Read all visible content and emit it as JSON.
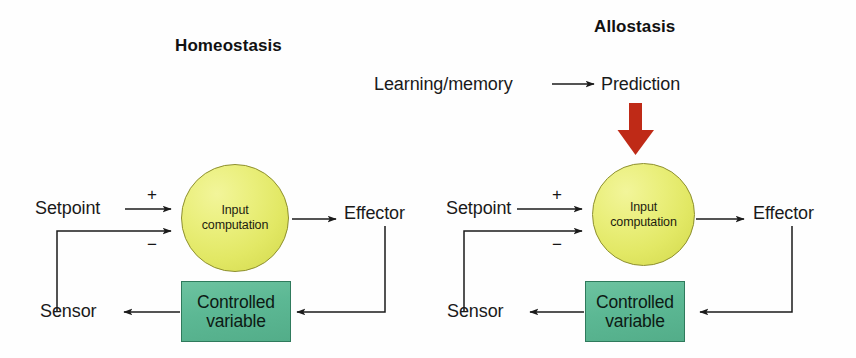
{
  "figure": {
    "background_color": "#fefefe",
    "panels": [
      {
        "id": "homeostasis",
        "title": "Homeostasis",
        "nodes": {
          "setpoint": "Setpoint",
          "sensor": "Sensor",
          "effector": "Effector",
          "computation_line1": "Input",
          "computation_line2": "computation",
          "controlled_line1": "Controlled",
          "controlled_line2": "variable"
        },
        "signs": {
          "positive": "+",
          "negative": "−"
        }
      },
      {
        "id": "allostasis",
        "title": "Allostasis",
        "nodes": {
          "learning": "Learning/memory",
          "prediction": "Prediction",
          "setpoint": "Setpoint",
          "sensor": "Sensor",
          "effector": "Effector",
          "computation_line1": "Input",
          "computation_line2": "computation",
          "controlled_line1": "Controlled",
          "controlled_line2": "variable"
        },
        "signs": {
          "positive": "+",
          "negative": "−"
        }
      }
    ],
    "colors": {
      "circle_fill": "#e8ee77",
      "circle_stroke": "#8d8f2e",
      "box_fill": "#5cb894",
      "box_stroke": "#2f7a5c",
      "arrow_black": "#1b1b1b",
      "arrow_red": "#bf2a17",
      "text": "#1a1a1a"
    }
  }
}
